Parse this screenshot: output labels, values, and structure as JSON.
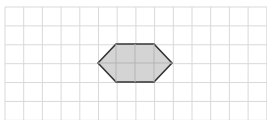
{
  "diagram": {
    "type": "grid-with-hexagon",
    "grid": {
      "columns": 14,
      "rows": 6,
      "line_color": "#d9d9d9"
    },
    "shape": {
      "name": "hexagon",
      "fill": "#d4d4d4",
      "stroke": "#333333",
      "vertices": [
        [
          98,
          63
        ],
        [
          116,
          44
        ],
        [
          154,
          44
        ],
        [
          172,
          63
        ],
        [
          154,
          82
        ],
        [
          116,
          82
        ]
      ]
    }
  }
}
